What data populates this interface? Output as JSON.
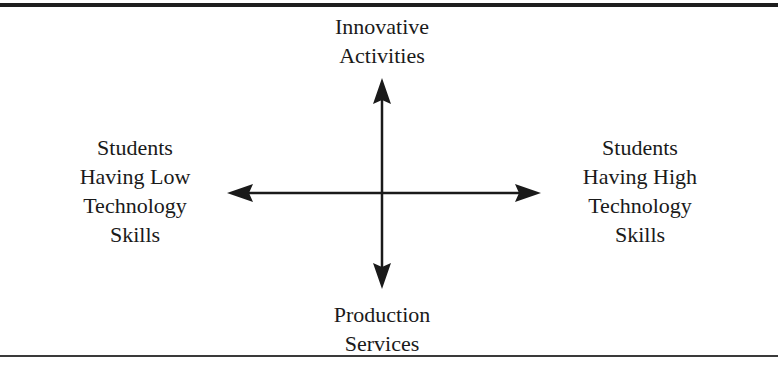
{
  "diagram": {
    "type": "quadrant-axes",
    "top_label": {
      "line1": "Innovative",
      "line2": "Activities"
    },
    "bottom_label": {
      "line1": "Production",
      "line2": "Services"
    },
    "left_label": {
      "line1": "Students",
      "line2": "Having Low",
      "line3": "Technology",
      "line4": "Skills"
    },
    "right_label": {
      "line1": "Students",
      "line2": "Having High",
      "line3": "Technology",
      "line4": "Skills"
    },
    "colors": {
      "line": "#1a1a1a",
      "text": "#1a1a1a",
      "background": "#ffffff"
    }
  }
}
